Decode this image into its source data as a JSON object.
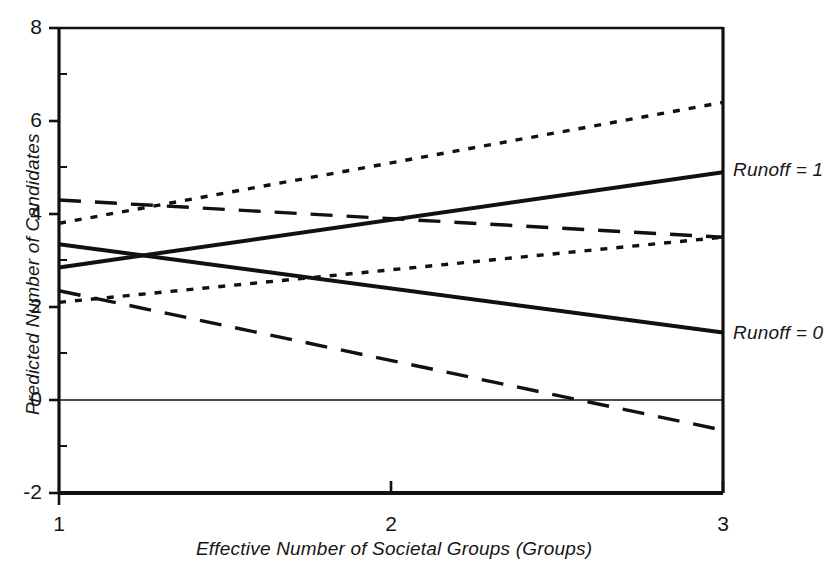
{
  "chart_data": {
    "type": "line",
    "title": "",
    "xlabel": "Effective Number of Societal Groups (Groups)",
    "ylabel": "Predicted Number of Candidates",
    "xlim": [
      1,
      3
    ],
    "ylim": [
      -2,
      8
    ],
    "xticks": [
      1,
      2,
      3
    ],
    "xtick_labels": [
      "1",
      "2",
      "3"
    ],
    "yticks": [
      -2,
      0,
      2,
      4,
      6,
      8
    ],
    "ytick_labels": [
      "-2",
      "0",
      "2",
      "4",
      "6",
      "8"
    ],
    "grid": false,
    "legend": "inline-right-annotations",
    "zero_line": true,
    "series": [
      {
        "name": "Runoff = 1",
        "style": "solid",
        "x": [
          1,
          3
        ],
        "values": [
          2.85,
          4.9
        ],
        "annotation": "Runoff = 1"
      },
      {
        "name": "Runoff = 0",
        "style": "solid",
        "x": [
          1,
          3
        ],
        "values": [
          3.35,
          1.45
        ],
        "annotation": "Runoff = 0"
      },
      {
        "name": "Upper confidence band (Runoff = 1)",
        "style": "dotted",
        "x": [
          1,
          3
        ],
        "values": [
          3.8,
          6.4
        ],
        "annotation": ""
      },
      {
        "name": "Lower confidence band (Runoff = 1)",
        "style": "dotted",
        "x": [
          1,
          3
        ],
        "values": [
          2.1,
          3.5
        ],
        "annotation": ""
      },
      {
        "name": "Upper confidence band (Runoff = 0)",
        "style": "dashed",
        "x": [
          1,
          3
        ],
        "values": [
          4.3,
          3.5
        ],
        "annotation": ""
      },
      {
        "name": "Lower confidence band (Runoff = 0)",
        "style": "dashed",
        "x": [
          1,
          3
        ],
        "values": [
          2.35,
          -0.65
        ],
        "annotation": ""
      }
    ]
  },
  "axes": {
    "y_tick_labels": [
      "8",
      "6",
      "4",
      "2",
      "0",
      "-2"
    ],
    "x_tick_labels": [
      "1",
      "2",
      "3"
    ],
    "y_axis_title": "Predicted Number of Candidates",
    "x_axis_title": "Effective Number of Societal Groups (Groups)"
  },
  "annotations": {
    "runoff_one": "Runoff = 1",
    "runoff_zero": "Runoff = 0"
  },
  "colors": {
    "line": "#111111",
    "axis": "#111111",
    "background": "#ffffff",
    "text": "#161616"
  }
}
